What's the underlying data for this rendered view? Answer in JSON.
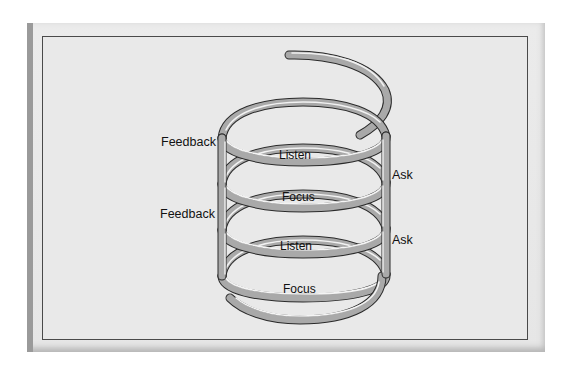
{
  "diagram": {
    "type": "spiral",
    "colors": {
      "background_page": "#ffffff",
      "panel": "#e8e8e8",
      "frame_border": "#4a4a4a",
      "coil": "#a9a9a9",
      "coil_highlight": "#f4f4f4",
      "coil_shadow": "#2a2a2a",
      "text": "#111111"
    },
    "labels": {
      "feedback_1": "Feedback",
      "feedback_2": "Feedback",
      "listen_1": "Listen",
      "listen_2": "Listen",
      "focus_1": "Focus",
      "focus_2": "Focus",
      "ask_1": "Ask",
      "ask_2": "Ask"
    },
    "cycle": [
      "Focus",
      "Listen",
      "Ask",
      "Feedback"
    ]
  }
}
